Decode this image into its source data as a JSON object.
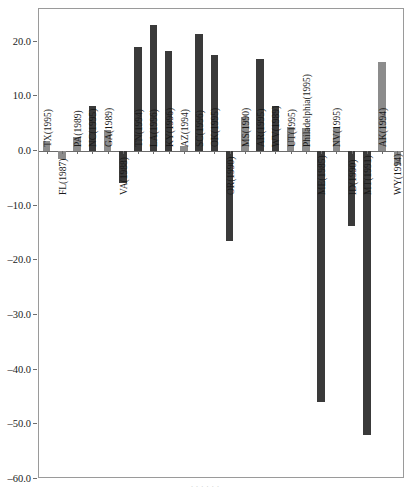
{
  "title_fragment": "·",
  "caption_fragment": "·  ·   · ·  ·  ·",
  "axis": {
    "y_ticks": [
      "20.0",
      "10.0",
      "0.0",
      "–10.0",
      "–20.0",
      "–30.0",
      "–40.0",
      "–50.0",
      "–60.0"
    ],
    "y_tick_values": [
      20,
      10,
      0,
      -10,
      -20,
      -30,
      -40,
      -50,
      -60
    ]
  },
  "colors": {
    "bar_dark": "#3a3a3a",
    "bar_light": "#8c8c8c",
    "frame": "#9a9a9a",
    "axis_text": "#1a1a1a",
    "background": "#ffffff"
  },
  "chart_data": {
    "type": "bar",
    "title": "",
    "xlabel": "",
    "ylabel": "",
    "ylim": [
      -60,
      26
    ],
    "grid": false,
    "legend": "none",
    "categories": [
      "TX(1995)",
      "FL(1987)",
      "PA(1989)",
      "NC(1995)",
      "GA(1989)",
      "VA(1988)",
      "TN(1994)",
      "LA(1996)",
      "KY(1996)",
      "AZ(1994)",
      "SC(1996)",
      "OK(1995)",
      "OR(1990)",
      "MS(1990)",
      "AR(1995)",
      "WV(1989)",
      "UT(1995)",
      "Philadelphia(1995)",
      "ME(1985)",
      "NV(1995)",
      "ID(1990)",
      "MT(1991)",
      "AK(1994)",
      "WY(1994)"
    ],
    "values": [
      1.8,
      -1.5,
      2.6,
      8.3,
      3.9,
      -5.8,
      19.0,
      23.0,
      18.3,
      1.0,
      21.5,
      17.5,
      -16.5,
      6.3,
      16.8,
      8.3,
      4.5,
      4.3,
      -46.0,
      4.3,
      -13.7,
      -52.0,
      16.3,
      -2.5
    ],
    "shades": [
      "light",
      "light",
      "light",
      "dark",
      "light",
      "dark",
      "dark",
      "dark",
      "dark",
      "light",
      "dark",
      "dark",
      "dark",
      "light",
      "dark",
      "dark",
      "light",
      "light",
      "dark",
      "light",
      "dark",
      "dark",
      "light",
      "light"
    ]
  }
}
